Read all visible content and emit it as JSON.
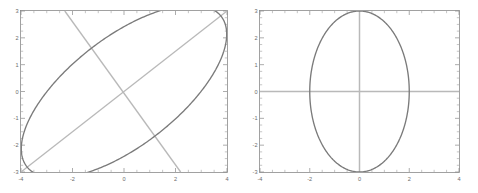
{
  "figure": {
    "title": "",
    "background_color": "#ffffff",
    "panel_count": 2
  },
  "chart_data": [
    {
      "panel": "left",
      "type": "line",
      "title": "",
      "xlabel": "",
      "ylabel": "",
      "xlim": [
        -4,
        4
      ],
      "ylim": [
        -3,
        3
      ],
      "xticks": [
        -4,
        -2,
        0,
        2,
        4
      ],
      "yticks": [
        -3,
        -2,
        -1,
        0,
        1,
        2,
        3
      ],
      "xtick_labels": [
        "-4",
        "-2",
        "0",
        "2",
        "4"
      ],
      "ytick_labels": [
        "-3",
        "-2",
        "-1",
        "0",
        "1",
        "2",
        "3"
      ],
      "grid": false,
      "legend": null,
      "series": [
        {
          "name": "rotated-ellipse",
          "kind": "ellipse",
          "color": "#7b7b7b",
          "center": [
            0,
            0
          ],
          "semi_major": 4.7,
          "semi_minor": 2.05,
          "rotation_deg": 36
        },
        {
          "name": "major-axis-line",
          "kind": "line",
          "color": "#b9b9b9",
          "x": [
            -4,
            4
          ],
          "y": [
            -3,
            3
          ]
        },
        {
          "name": "minor-axis-line",
          "kind": "line",
          "color": "#b9b9b9",
          "x": [
            -2.3,
            2.2
          ],
          "y": [
            3,
            -3
          ]
        }
      ]
    },
    {
      "panel": "right",
      "type": "line",
      "title": "",
      "xlabel": "",
      "ylabel": "",
      "xlim": [
        -4,
        4
      ],
      "ylim": [
        -3,
        3
      ],
      "xticks": [
        -4,
        -2,
        0,
        2,
        4
      ],
      "yticks": [
        -3,
        -2,
        -1,
        0,
        1,
        2,
        3
      ],
      "xtick_labels": [
        "-4",
        "-2",
        "0",
        "2",
        "4"
      ],
      "ytick_labels": [
        "-3",
        "-2",
        "-1",
        "0",
        "1",
        "2",
        "3"
      ],
      "grid": false,
      "legend": null,
      "series": [
        {
          "name": "axis-aligned-ellipse",
          "kind": "ellipse",
          "color": "#7b7b7b",
          "center": [
            0,
            0
          ],
          "semi_axis_x": 2.0,
          "semi_axis_y": 3.0,
          "rotation_deg": 0
        },
        {
          "name": "horizontal-axis-line",
          "kind": "line",
          "color": "#b9b9b9",
          "x": [
            -4,
            4
          ],
          "y": [
            0,
            0
          ]
        },
        {
          "name": "vertical-axis-line",
          "kind": "line",
          "color": "#b9b9b9",
          "x": [
            0,
            0
          ],
          "y": [
            -3,
            3
          ]
        }
      ]
    }
  ]
}
